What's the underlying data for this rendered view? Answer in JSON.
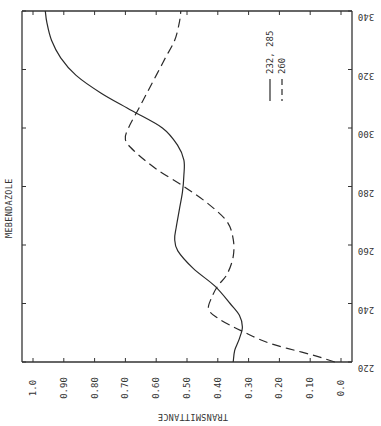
{
  "chart_data": {
    "type": "line",
    "title": "MEBENDAZOLE",
    "xlabel": "WAVELENGTH (nm)",
    "ylabel": "TRANSMITTANCE",
    "orientation": "rotated 90° (wavelength axis runs vertically along the right edge, increasing upward; transmittance axis along the bottom, decreasing left-to-right)",
    "xlim": [
      220,
      340
    ],
    "ylim": [
      0.0,
      1.0
    ],
    "x_ticks": [
      220,
      240,
      260,
      280,
      300,
      320,
      340
    ],
    "x_tick_labels": [
      "220",
      "240",
      "260",
      "280",
      "300",
      "320",
      "340"
    ],
    "y_ticks": [
      1.0,
      0.9,
      0.8,
      0.7,
      0.6,
      0.5,
      0.4,
      0.3,
      0.2,
      0.1,
      0.0
    ],
    "y_tick_labels": [
      "1.0",
      "0.90",
      "0.80",
      "0.70",
      "0.60",
      "0.50",
      "0.40",
      "0.30",
      "0.20",
      "0.10",
      "0.0"
    ],
    "grid": false,
    "legend_position": "upper right (rotated)",
    "series": [
      {
        "name": "232, 285",
        "style": "solid",
        "x": [
          220,
          224,
          228,
          232,
          236,
          240,
          246,
          252,
          258,
          262,
          266,
          272,
          278,
          284,
          289,
          294,
          300,
          306,
          312,
          318,
          324,
          330,
          336,
          340
        ],
        "y": [
          0.35,
          0.345,
          0.33,
          0.32,
          0.33,
          0.36,
          0.41,
          0.48,
          0.53,
          0.54,
          0.535,
          0.525,
          0.515,
          0.51,
          0.51,
          0.53,
          0.58,
          0.68,
          0.78,
          0.86,
          0.91,
          0.94,
          0.955,
          0.96
        ]
      },
      {
        "name": "260",
        "style": "dashed",
        "x": [
          220,
          222,
          224,
          226,
          228,
          230,
          232,
          235,
          238,
          242,
          246,
          250,
          256,
          262,
          268,
          274,
          280,
          286,
          292,
          296,
          300,
          306,
          312,
          318,
          324,
          330,
          336,
          340
        ],
        "y": [
          0.02,
          0.08,
          0.15,
          0.22,
          0.27,
          0.31,
          0.35,
          0.4,
          0.43,
          0.42,
          0.4,
          0.37,
          0.35,
          0.35,
          0.37,
          0.43,
          0.51,
          0.6,
          0.67,
          0.7,
          0.69,
          0.66,
          0.63,
          0.6,
          0.57,
          0.54,
          0.525,
          0.52
        ]
      }
    ]
  }
}
